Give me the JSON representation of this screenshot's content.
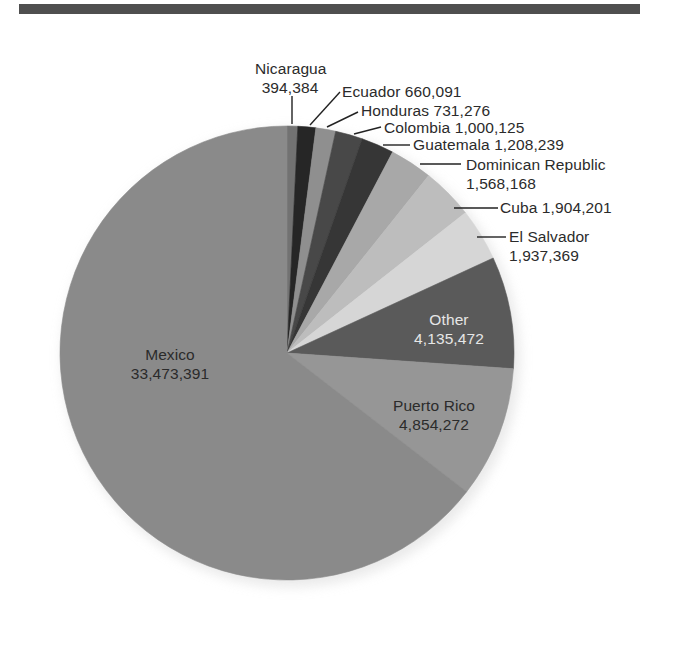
{
  "chart_data": {
    "type": "pie",
    "title": "",
    "start_angle_deg": 0,
    "direction": "clockwise",
    "slices": [
      {
        "label": "Nicaragua",
        "value": 394384,
        "value_text": "394,384",
        "color": "#727272"
      },
      {
        "label": "Ecuador",
        "value": 660091,
        "value_text": "660,091",
        "color": "#262626"
      },
      {
        "label": "Honduras",
        "value": 731276,
        "value_text": "731,276",
        "color": "#8f8f8f"
      },
      {
        "label": "Colombia",
        "value": 1000125,
        "value_text": "1,000,125",
        "color": "#484848"
      },
      {
        "label": "Guatemala",
        "value": 1208239,
        "value_text": "1,208,239",
        "color": "#363636"
      },
      {
        "label": "Dominican Republic",
        "value": 1568168,
        "value_text": "1,568,168",
        "color": "#a8a8a8"
      },
      {
        "label": "Cuba",
        "value": 1904201,
        "value_text": "1,904,201",
        "color": "#bdbdbd"
      },
      {
        "label": "El Salvador",
        "value": 1937369,
        "value_text": "1,937,369",
        "color": "#d6d6d6"
      },
      {
        "label": "Other",
        "value": 4135472,
        "value_text": "4,135,472",
        "color": "#5a5a5a"
      },
      {
        "label": "Puerto Rico",
        "value": 4854272,
        "value_text": "4,854,272",
        "color": "#969696"
      },
      {
        "label": "Mexico",
        "value": 33473391,
        "value_text": "33,473,391",
        "color": "#8a8a8a"
      }
    ],
    "legend": "none (direct labels with leader lines)"
  },
  "labels": {
    "nicaragua": {
      "name": "Nicaragua",
      "value": "394,384"
    },
    "ecuador": "Ecuador 660,091",
    "honduras": "Honduras 731,276",
    "colombia": "Colombia 1,000,125",
    "guatemala": "Guatemala 1,208,239",
    "dominican_republic": {
      "name": "Dominican Republic",
      "value": "1,568,168"
    },
    "cuba": "Cuba 1,904,201",
    "el_salvador": {
      "name": "El Salvador",
      "value": "1,937,369"
    },
    "other": {
      "name": "Other",
      "value": "4,135,472"
    },
    "puerto_rico": {
      "name": "Puerto Rico",
      "value": "4,854,272"
    },
    "mexico": {
      "name": "Mexico",
      "value": "33,473,391"
    }
  },
  "style": {
    "rule_color": "#4f4f4f",
    "leader_color": "#222222"
  }
}
